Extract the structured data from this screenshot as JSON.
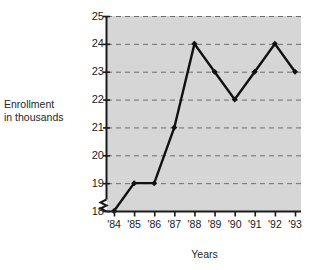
{
  "chart_data": {
    "type": "line",
    "title": "",
    "xlabel": "Years",
    "ylabel": "Enrollment in thousands",
    "categories": [
      "'84",
      "'85",
      "'86",
      "'87",
      "'88",
      "'89",
      "'90",
      "'91",
      "'92",
      "'93"
    ],
    "values": [
      18,
      19,
      19,
      21,
      24,
      23,
      22,
      23,
      24,
      23
    ],
    "series": [
      {
        "name": "Enrollment",
        "values": [
          18,
          19,
          19,
          21,
          24,
          23,
          22,
          23,
          24,
          23
        ]
      }
    ],
    "ylim": [
      18,
      25
    ],
    "yticks": [
      18,
      19,
      20,
      21,
      22,
      23,
      24,
      25
    ],
    "ytick_labels": [
      "18",
      "19",
      "20",
      "21",
      "22",
      "23",
      "24",
      "25"
    ],
    "xtick_labels": [
      "'84",
      "'85",
      "'86",
      "'87",
      "'88",
      "'89",
      "'90",
      "'91",
      "'92",
      "'93"
    ],
    "grid": "horizontal-dashed",
    "legend": "none",
    "axis_break": true,
    "marker": "filled-diamond",
    "colors": {
      "plot_background": "#d6d6d6",
      "line": "#111111",
      "marker": "#111111",
      "gridline": "#6e6e6e",
      "axis": "#1a1a1a",
      "text": "#1a1a1a",
      "page_background": "#ffffff"
    }
  },
  "axis_captions": {
    "y_line1": "Enrollment",
    "y_line2": "in thousands",
    "x": "Years"
  }
}
